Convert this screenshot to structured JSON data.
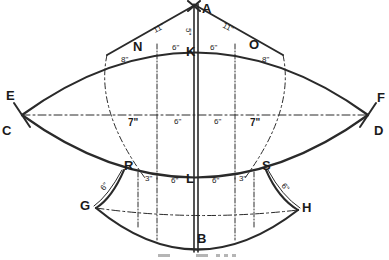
{
  "diagram": {
    "points": {
      "A": "A",
      "B": "B",
      "C": "C",
      "D": "D",
      "E": "E",
      "F": "F",
      "G": "G",
      "H": "H",
      "K": "K",
      "L": "L",
      "N": "N",
      "O": "O",
      "R": "R",
      "S": "S"
    },
    "dimensions": {
      "AN": "11\"",
      "AO": "11\"",
      "AK": "5\"",
      "NK": "6\"",
      "KO": "6\"",
      "N_below": "8\"",
      "O_below": "8\"",
      "mid_left_outer": "7\"",
      "mid_left_inner": "6\"",
      "mid_right_inner": "6\"",
      "mid_right_outer": "7\"",
      "RL_outer": "3\"",
      "RL_inner": "6\"",
      "LS_inner": "6\"",
      "LS_outer": "3\"",
      "GR": "6\"",
      "SH": "6\""
    },
    "caption": ""
  },
  "colors": {
    "ink": "#2a2a2a",
    "paper": "#ffffff"
  }
}
